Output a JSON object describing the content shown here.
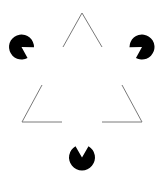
{
  "figure": {
    "width": 156,
    "height": 178,
    "background": "#ffffff",
    "line_color": "#7a7a7a",
    "disk_color": "#000000",
    "outline_triangle": {
      "description": "Inverted-looking open outline triangle made of three V-shaped corner segments",
      "corners": [
        {
          "name": "top",
          "vertex": [
            82,
            13
          ],
          "arm_ends": [
            [
              63,
              47
            ],
            [
              102,
              47
            ]
          ]
        },
        {
          "name": "bottom-left",
          "vertex": [
            22,
            122
          ],
          "arm_ends": [
            [
              42,
              85
            ],
            [
              62,
              122
            ]
          ]
        },
        {
          "name": "bottom-right",
          "vertex": [
            142,
            122
          ],
          "arm_ends": [
            [
              122,
              85
            ],
            [
              102,
              122
            ]
          ]
        }
      ]
    },
    "pacman_disks": [
      {
        "name": "left",
        "center": [
          21.5,
          47
        ],
        "radius": 12.5,
        "mouth_direction_deg": 31,
        "mouth_angle_deg": 60
      },
      {
        "name": "right",
        "center": [
          142,
          47
        ],
        "radius": 12.5,
        "mouth_direction_deg": 149,
        "mouth_angle_deg": 60
      },
      {
        "name": "bottom",
        "center": [
          82,
          157.5
        ],
        "radius": 13,
        "mouth_direction_deg": -90,
        "mouth_angle_deg": 60
      }
    ]
  }
}
